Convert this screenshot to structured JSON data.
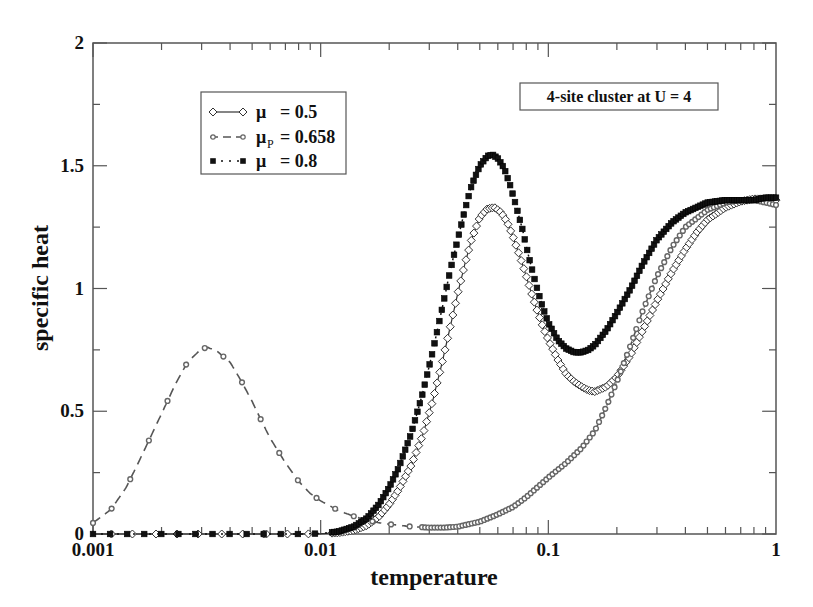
{
  "chart_data": {
    "type": "line",
    "title": "",
    "xlabel": "temperature",
    "ylabel": "specific  heat",
    "xscale": "log",
    "xlim": [
      0.001,
      1
    ],
    "ylim": [
      0,
      2
    ],
    "xticks": [
      {
        "value": 0.001,
        "label": "0.001"
      },
      {
        "value": 0.01,
        "label": "0.01"
      },
      {
        "value": 0.1,
        "label": "0.1"
      },
      {
        "value": 1,
        "label": "1"
      }
    ],
    "yticks": [
      {
        "value": 0,
        "label": "0"
      },
      {
        "value": 0.5,
        "label": "0.5"
      },
      {
        "value": 1,
        "label": "1"
      },
      {
        "value": 1.5,
        "label": "1.5"
      },
      {
        "value": 2,
        "label": "2"
      }
    ],
    "grid": false,
    "legend_position": "upper-left",
    "annotation": "4-site cluster at U = 4",
    "series": [
      {
        "name": "μ = 0.5",
        "legend_symbol": "μ",
        "legend_sub": "",
        "legend_value": "=  0.5",
        "style": "solid-diamond",
        "color": "#333333",
        "x": [
          0.001,
          0.002,
          0.004,
          0.006,
          0.008,
          0.01,
          0.012,
          0.014,
          0.016,
          0.018,
          0.02,
          0.022,
          0.025,
          0.028,
          0.031,
          0.034,
          0.037,
          0.04,
          0.043,
          0.046,
          0.05,
          0.054,
          0.058,
          0.062,
          0.066,
          0.07,
          0.075,
          0.08,
          0.085,
          0.09,
          0.095,
          0.1,
          0.11,
          0.12,
          0.13,
          0.14,
          0.15,
          0.16,
          0.18,
          0.2,
          0.23,
          0.26,
          0.3,
          0.35,
          0.4,
          0.45,
          0.5,
          0.6,
          0.7,
          0.8,
          0.9,
          1.0
        ],
        "y": [
          0,
          0,
          0,
          0,
          0,
          0.001,
          0.005,
          0.015,
          0.035,
          0.07,
          0.12,
          0.18,
          0.28,
          0.4,
          0.54,
          0.69,
          0.84,
          0.98,
          1.1,
          1.2,
          1.29,
          1.325,
          1.33,
          1.31,
          1.27,
          1.21,
          1.13,
          1.05,
          0.97,
          0.9,
          0.84,
          0.79,
          0.71,
          0.65,
          0.62,
          0.6,
          0.585,
          0.58,
          0.6,
          0.64,
          0.73,
          0.83,
          0.95,
          1.07,
          1.16,
          1.23,
          1.28,
          1.33,
          1.355,
          1.365,
          1.365,
          1.36
        ]
      },
      {
        "name": "μP = 0.658",
        "legend_symbol": "μ",
        "legend_sub": "P",
        "legend_value": "= 0.658",
        "style": "dashed-circle",
        "color": "#666666",
        "x": [
          0.001,
          0.0012,
          0.0014,
          0.0016,
          0.0018,
          0.002,
          0.0023,
          0.0026,
          0.003,
          0.0032,
          0.0035,
          0.004,
          0.0045,
          0.005,
          0.0055,
          0.006,
          0.007,
          0.008,
          0.009,
          0.01,
          0.012,
          0.014,
          0.016,
          0.018,
          0.02,
          0.025,
          0.03,
          0.035,
          0.04,
          0.05,
          0.06,
          0.07,
          0.08,
          0.1,
          0.12,
          0.14,
          0.16,
          0.18,
          0.2,
          0.23,
          0.26,
          0.3,
          0.35,
          0.4,
          0.5,
          0.6,
          0.7,
          0.8,
          0.9,
          1.0
        ],
        "y": [
          0.045,
          0.1,
          0.19,
          0.3,
          0.4,
          0.49,
          0.61,
          0.7,
          0.755,
          0.76,
          0.745,
          0.7,
          0.62,
          0.54,
          0.46,
          0.39,
          0.29,
          0.215,
          0.165,
          0.135,
          0.095,
          0.072,
          0.056,
          0.046,
          0.04,
          0.03,
          0.026,
          0.026,
          0.03,
          0.05,
          0.08,
          0.11,
          0.15,
          0.23,
          0.29,
          0.35,
          0.42,
          0.52,
          0.62,
          0.77,
          0.91,
          1.05,
          1.17,
          1.25,
          1.32,
          1.35,
          1.36,
          1.36,
          1.35,
          1.34
        ]
      },
      {
        "name": "μ = 0.8",
        "legend_symbol": "μ",
        "legend_sub": "",
        "legend_value": "=  0.8",
        "style": "dotted-square",
        "color": "#111111",
        "x": [
          0.001,
          0.002,
          0.004,
          0.006,
          0.008,
          0.01,
          0.012,
          0.014,
          0.016,
          0.018,
          0.02,
          0.022,
          0.025,
          0.028,
          0.031,
          0.034,
          0.037,
          0.04,
          0.043,
          0.046,
          0.05,
          0.054,
          0.057,
          0.06,
          0.064,
          0.068,
          0.072,
          0.077,
          0.082,
          0.088,
          0.094,
          0.1,
          0.11,
          0.12,
          0.13,
          0.14,
          0.15,
          0.16,
          0.18,
          0.2,
          0.23,
          0.26,
          0.3,
          0.35,
          0.4,
          0.5,
          0.6,
          0.7,
          0.8,
          0.9,
          1.0
        ],
        "y": [
          0,
          0,
          0,
          0,
          0,
          0.002,
          0.01,
          0.03,
          0.065,
          0.12,
          0.19,
          0.27,
          0.41,
          0.57,
          0.74,
          0.91,
          1.07,
          1.2,
          1.32,
          1.42,
          1.5,
          1.54,
          1.545,
          1.53,
          1.49,
          1.42,
          1.34,
          1.24,
          1.13,
          1.02,
          0.93,
          0.86,
          0.79,
          0.755,
          0.74,
          0.74,
          0.75,
          0.77,
          0.83,
          0.9,
          1.0,
          1.1,
          1.2,
          1.27,
          1.31,
          1.35,
          1.36,
          1.36,
          1.36,
          1.37,
          1.37
        ]
      }
    ]
  }
}
